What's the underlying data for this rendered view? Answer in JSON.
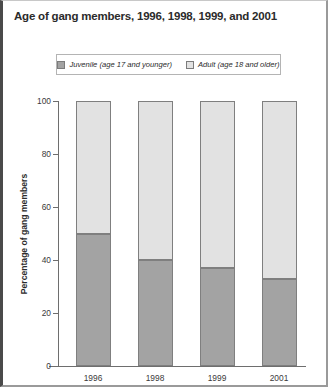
{
  "title": "Age of gang members, 1996, 1998, 1999, and 2001",
  "legend": {
    "entries": [
      {
        "label": "Juvenile (age 17 and younger)",
        "color": "#a3a3a3",
        "name": "juvenile"
      },
      {
        "label": "Adult (age 18 and older)",
        "color": "#e2e2e2",
        "name": "adult"
      }
    ]
  },
  "colors": {
    "juvenile": "#a3a3a3",
    "adult": "#e2e2e2",
    "axis": "#6e6e6e",
    "border": "#7f7f7f",
    "text": "#2b2b2b",
    "frame": "#9a9a9a"
  },
  "chart_data": {
    "type": "bar",
    "title": "Age of gang members, 1996, 1998, 1999, and 2001",
    "xlabel": "",
    "ylabel": "Percentage of gang members",
    "stacked": true,
    "stack_total": 100,
    "categories": [
      "1996",
      "1998",
      "1999",
      "2001"
    ],
    "series": [
      {
        "name": "Juvenile (age 17 and younger)",
        "values": [
          50,
          40,
          37,
          33
        ]
      },
      {
        "name": "Adult (age 18 and older)",
        "values": [
          50,
          60,
          63,
          67
        ]
      }
    ],
    "ylim": [
      0,
      100
    ],
    "yticks": [
      0,
      20,
      40,
      60,
      80,
      100
    ],
    "ytick_labels": [
      "0",
      "20",
      "40",
      "60",
      "80",
      "100"
    ],
    "grid": false,
    "legend_position": "top-center"
  }
}
